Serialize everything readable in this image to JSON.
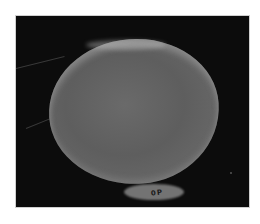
{
  "image": {
    "description": "Grayscale micrograph of a rounded, disc-like specimen on a black background",
    "subject": "rounded specimen",
    "background_color": "#0c0c0c",
    "specimen_color": "#636363",
    "rim_color": "#b5b5b5",
    "frame_border_color": "#cfcfcf",
    "page_background": "#ffffff",
    "edge_label": "0P"
  }
}
